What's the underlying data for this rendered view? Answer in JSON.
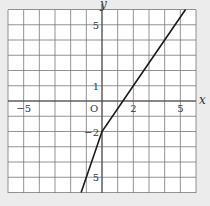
{
  "chart_data": {
    "type": "line",
    "title": "",
    "xlabel": "x",
    "ylabel": "y",
    "xlim": [
      -6,
      6
    ],
    "ylim": [
      -6,
      6
    ],
    "grid": true,
    "origin_label": "O",
    "x_tick_labels": [
      {
        "value": -5,
        "label": "−5"
      },
      {
        "value": 2,
        "label": "2"
      },
      {
        "value": 5,
        "label": "5"
      }
    ],
    "y_tick_labels": [
      {
        "value": 5,
        "label": "5"
      },
      {
        "value": 1,
        "label": "1"
      },
      {
        "value": -2,
        "label": "−2"
      },
      {
        "value": -5,
        "label": "5"
      }
    ],
    "series": [
      {
        "name": "y = 3/2 x − 2",
        "slope": 1.5,
        "intercept": -2,
        "points": [
          [
            -1.333,
            -6
          ],
          [
            0,
            -2
          ],
          [
            2,
            1
          ],
          [
            5.333,
            6
          ]
        ]
      }
    ],
    "colors": {
      "background": "#ececec",
      "plot_area": "#ffffff",
      "grid": "#777777",
      "line": "#1a1a1a",
      "text": "#333333"
    }
  }
}
